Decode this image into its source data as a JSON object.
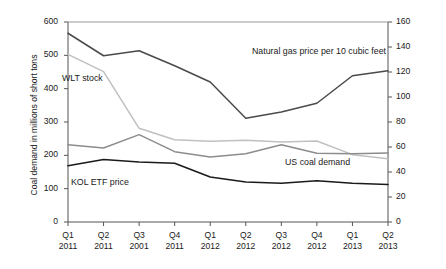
{
  "chart_data": {
    "type": "line",
    "title": "",
    "xlabel": "",
    "categories": [
      {
        "quarter": "Q1",
        "year": "2011"
      },
      {
        "quarter": "Q2",
        "year": "2011"
      },
      {
        "quarter": "Q3",
        "year": "2001"
      },
      {
        "quarter": "Q4",
        "year": "2011"
      },
      {
        "quarter": "Q1",
        "year": "2012"
      },
      {
        "quarter": "Q2",
        "year": "2012"
      },
      {
        "quarter": "Q3",
        "year": "2012"
      },
      {
        "quarter": "Q4",
        "year": "2012"
      },
      {
        "quarter": "Q1",
        "year": "2013"
      },
      {
        "quarter": "Q2",
        "year": "2013"
      }
    ],
    "axes": {
      "left": {
        "label": "Coal demand in millions of short tons",
        "min": 0,
        "max": 600,
        "step": 100,
        "ticks": [
          0,
          100,
          200,
          300,
          400,
          500,
          600
        ]
      },
      "right": {
        "label": "Price in dollars",
        "min": 0,
        "max": 160,
        "step": 20,
        "ticks": [
          0,
          20,
          40,
          60,
          80,
          100,
          120,
          140,
          160
        ]
      }
    },
    "grid": false,
    "legend_position": "inline-annotations",
    "series": [
      {
        "name": "Natural gas price per 10 cubic feet",
        "label_text_line1": "Natural gas price per",
        "label_text_line2": "10 cubic feet",
        "axis": "right",
        "color": "#4a4a4a",
        "width": 1.5,
        "values": [
          151,
          133,
          137,
          125,
          112,
          83,
          88,
          95,
          117,
          121
        ]
      },
      {
        "name": "WLT stock",
        "label_text_line1": "WLT stock",
        "label_text_line2": "",
        "axis": "left",
        "color": "#c0c0c0",
        "width": 1.5,
        "values": [
          503,
          451,
          281,
          247,
          242,
          245,
          240,
          243,
          202,
          190
        ]
      },
      {
        "name": "US coal demand",
        "label_text_line1": "US coal demand",
        "label_text_line2": "",
        "axis": "left",
        "color": "#8c8c8c",
        "width": 1.5,
        "values": [
          232,
          222,
          262,
          211,
          195,
          205,
          232,
          206,
          205,
          207
        ]
      },
      {
        "name": "KOL ETF price",
        "label_text_line1": "KOL ETF price",
        "label_text_line2": "",
        "axis": "right",
        "color": "#1a1a1a",
        "width": 1.6,
        "values": [
          45,
          50,
          48,
          47,
          36,
          32,
          31,
          33,
          31,
          30
        ]
      }
    ]
  },
  "annotations": {
    "natural_gas_label": "Natural gas price per",
    "natural_gas_label_2": "10 cubic feet",
    "wlt_label": "WLT stock",
    "us_coal_label": "US coal demand",
    "kol_label": "KOL ETF price"
  }
}
